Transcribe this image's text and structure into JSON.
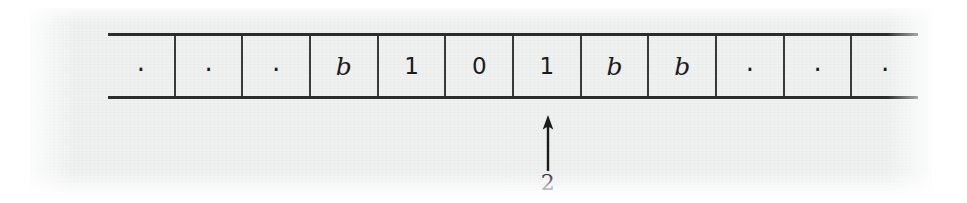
{
  "figure": {
    "kind": "turing-machine-tape",
    "paper_color": "#eff0f0",
    "ink_color": "#1b1b1b",
    "page_background": "#ffffff"
  },
  "tape": {
    "cell_count": 12,
    "cells": [
      {
        "symbol": ".",
        "kind": "dot"
      },
      {
        "symbol": ".",
        "kind": "dot"
      },
      {
        "symbol": ".",
        "kind": "dot"
      },
      {
        "symbol": "b",
        "kind": "blank"
      },
      {
        "symbol": "1",
        "kind": "digit"
      },
      {
        "symbol": "0",
        "kind": "digit"
      },
      {
        "symbol": "1",
        "kind": "digit"
      },
      {
        "symbol": "b",
        "kind": "blank"
      },
      {
        "symbol": "b",
        "kind": "blank"
      },
      {
        "symbol": ".",
        "kind": "dot"
      },
      {
        "symbol": ".",
        "kind": "dot"
      },
      {
        "symbol": ".",
        "kind": "dot"
      }
    ]
  },
  "head": {
    "label": "2",
    "points_to_cell_index": 6,
    "direction": "up"
  }
}
